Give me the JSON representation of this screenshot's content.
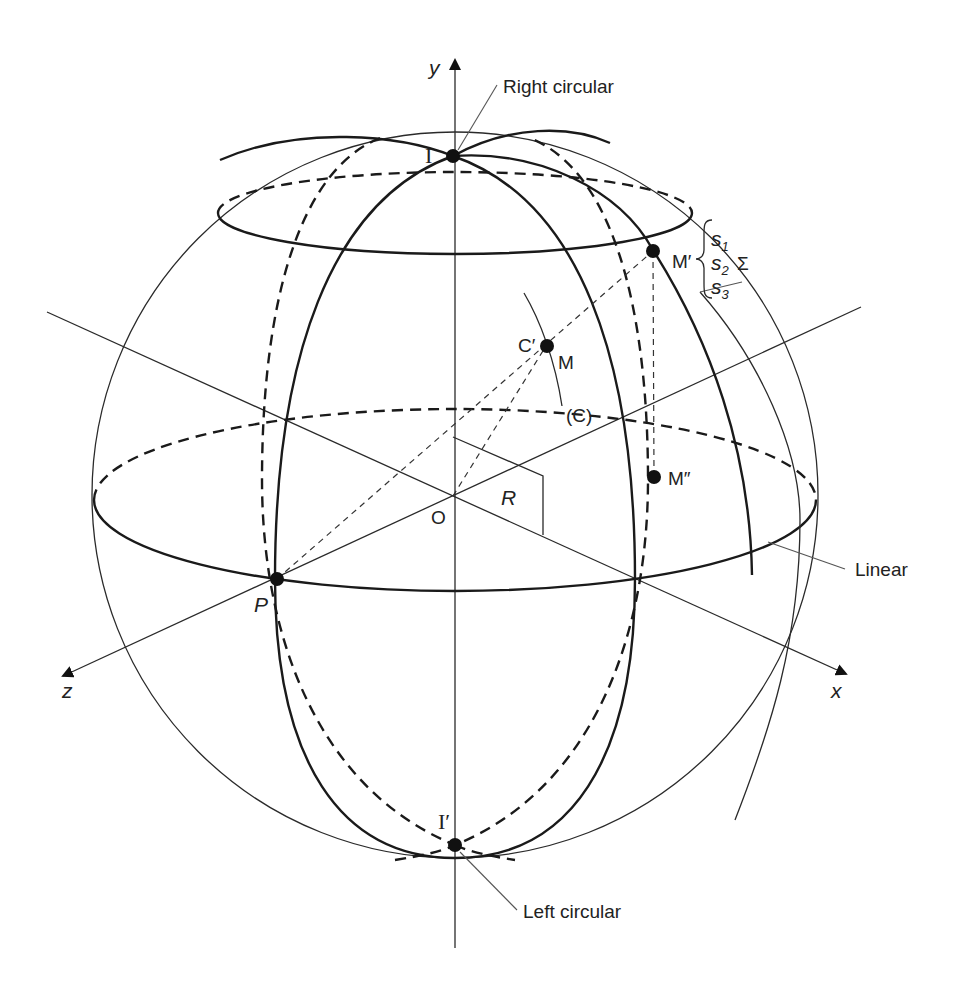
{
  "diagram": {
    "axes": {
      "x": "x",
      "y": "y",
      "z": "z"
    },
    "points": {
      "I": "I",
      "I_prime": "I′",
      "P": "P",
      "O": "O",
      "M_prime": "M′",
      "M": "M",
      "C_prime": "C′",
      "M_double_prime": "M″"
    },
    "labels": {
      "right_circular": "Right circular",
      "left_circular": "Left circular",
      "linear": "Linear",
      "radius": "R",
      "curve_C": "(C)",
      "sigma": "Σ"
    },
    "stokes": [
      {
        "base": "s",
        "sub": "1"
      },
      {
        "base": "s",
        "sub": "2"
      },
      {
        "base": "s",
        "sub": "3"
      }
    ]
  }
}
